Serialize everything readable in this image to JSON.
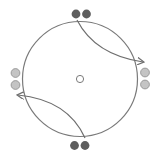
{
  "diagram": {
    "colors": {
      "ring": "#7a7a7a",
      "arrow": "#6e6e6e",
      "dark_particle": "#5e5e5e",
      "light_particle": "#c4c4c4",
      "light_particle_stroke": "#8a8a8a",
      "center_marker_stroke": "#7a7a7a",
      "center_marker_fill": "#ffffff"
    },
    "particle_groups": [
      {
        "position": "top",
        "shade": "dark",
        "count": 2
      },
      {
        "position": "right",
        "shade": "light",
        "count": 2
      },
      {
        "position": "bottom",
        "shade": "dark",
        "count": 2
      },
      {
        "position": "left",
        "shade": "light",
        "count": 2
      }
    ],
    "arrows": [
      {
        "from": "top",
        "to": "right",
        "direction": "clockwise"
      },
      {
        "from": "bottom",
        "to": "left",
        "direction": "clockwise"
      }
    ],
    "center_marker": "hollow-circle"
  }
}
